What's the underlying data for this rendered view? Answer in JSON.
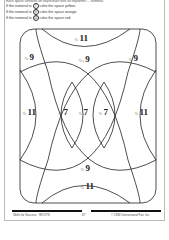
{
  "header": {
    "intro": "Each space contains an expression with an exponent ... numeral.",
    "rules": [
      {
        "prefix": "If the numeral is",
        "value": "7",
        "suffix": "color the space yellow."
      },
      {
        "prefix": "If the numeral is",
        "value": "9",
        "suffix": "color the space orange."
      },
      {
        "prefix": "If the numeral is",
        "value": "11",
        "suffix": "color the space red."
      }
    ]
  },
  "puzzle": {
    "labels": [
      {
        "prefix": "·⅓·",
        "num": "11"
      },
      {
        "prefix": "·⅓·",
        "num": "9"
      },
      {
        "prefix": "·⅓·+",
        "num": "9"
      },
      {
        "prefix": "·⅓·",
        "num": "9"
      },
      {
        "prefix": "·⅓·",
        "num": "11"
      },
      {
        "prefix": "·⅓·",
        "num": "7"
      },
      {
        "prefix": "·⅓·",
        "num": "7"
      },
      {
        "prefix": "·⅓·",
        "num": "7"
      },
      {
        "prefix": "·⅓·",
        "num": "11"
      },
      {
        "prefix": "·⅓·",
        "num": "9"
      },
      {
        "prefix": "·⅓·",
        "num": "11"
      }
    ]
  },
  "footer": {
    "left": "Skills for Success · ROOTS",
    "page": "67",
    "right": "© 1992 Instructional Fair, Inc."
  }
}
